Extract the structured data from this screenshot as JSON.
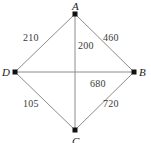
{
  "figure": {
    "type": "weighted-graph-diagram",
    "shape": "rhombus-with-diagonals",
    "background_color": "#ffffff",
    "line_color": "#8c8c8c",
    "node_color": "#111111",
    "label_color": "#3a3a3a",
    "vertex_label_color": "#1a1a1a",
    "width": 151,
    "height": 143
  },
  "vertices": [
    {
      "id": "A",
      "label": "A",
      "x": 75,
      "y": 14,
      "label_x": 72,
      "label_y": 1
    },
    {
      "id": "B",
      "label": "B",
      "x": 134,
      "y": 72,
      "label_x": 139,
      "label_y": 67
    },
    {
      "id": "C",
      "label": "C",
      "x": 75,
      "y": 130,
      "label_x": 72,
      "label_y": 136
    },
    {
      "id": "D",
      "label": "D",
      "x": 15,
      "y": 72,
      "label_x": 2,
      "label_y": 67
    }
  ],
  "edges": [
    {
      "id": "DA",
      "from": "D",
      "to": "A",
      "weight": "210",
      "label_x": 23,
      "label_y": 33
    },
    {
      "id": "AB",
      "from": "A",
      "to": "B",
      "weight": "460",
      "label_x": 103,
      "label_y": 33
    },
    {
      "id": "AC",
      "from": "A",
      "to": "C",
      "weight": "200",
      "label_x": 78,
      "label_y": 41
    },
    {
      "id": "DB",
      "from": "D",
      "to": "B",
      "weight": "680",
      "label_x": 90,
      "label_y": 79
    },
    {
      "id": "DC",
      "from": "D",
      "to": "C",
      "weight": "105",
      "label_x": 23,
      "label_y": 99
    },
    {
      "id": "CB",
      "from": "C",
      "to": "B",
      "weight": "720",
      "label_x": 103,
      "label_y": 99
    }
  ]
}
